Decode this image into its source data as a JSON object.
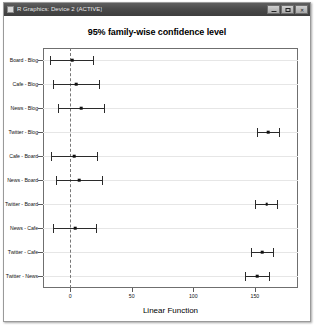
{
  "window": {
    "title": "R Graphics: Device 2 (ACTIVE)",
    "icon": "r-graphics-icon",
    "buttons": {
      "minimize": "minimize-icon",
      "maximize": "maximize-icon",
      "close": "✕"
    }
  },
  "chart_data": {
    "type": "scatter",
    "title": "95% family-wise confidence level",
    "xlabel": "Linear Function",
    "ylabel": "",
    "xlim": [
      -22,
      185
    ],
    "xticks": [
      0,
      50,
      100,
      150
    ],
    "xticklabels": [
      "0",
      "50",
      "100",
      "150"
    ],
    "grid": true,
    "legend": null,
    "reference_line": 0,
    "categories": [
      "Board - Blog",
      "Cafe - Blog",
      "News - Blog",
      "Twitter - Blog",
      "Cafe - Board",
      "News - Board",
      "Twitter - Board",
      "News - Cafe",
      "Twitter - Cafe",
      "Twitter - News"
    ],
    "series": [
      {
        "name": "difference estimate",
        "values": [
          1.5,
          5.0,
          9.0,
          161.0,
          3.5,
          7.5,
          159.5,
          4.0,
          156.0,
          152.0
        ]
      },
      {
        "name": "lower confidence limit",
        "values": [
          -16.0,
          -14.0,
          -10.0,
          152.0,
          -15.5,
          -11.5,
          150.0,
          -13.5,
          146.5,
          142.0
        ]
      },
      {
        "name": "upper confidence limit",
        "values": [
          19.0,
          24.0,
          28.0,
          170.0,
          22.5,
          26.5,
          169.0,
          21.5,
          165.5,
          162.0
        ]
      }
    ]
  }
}
